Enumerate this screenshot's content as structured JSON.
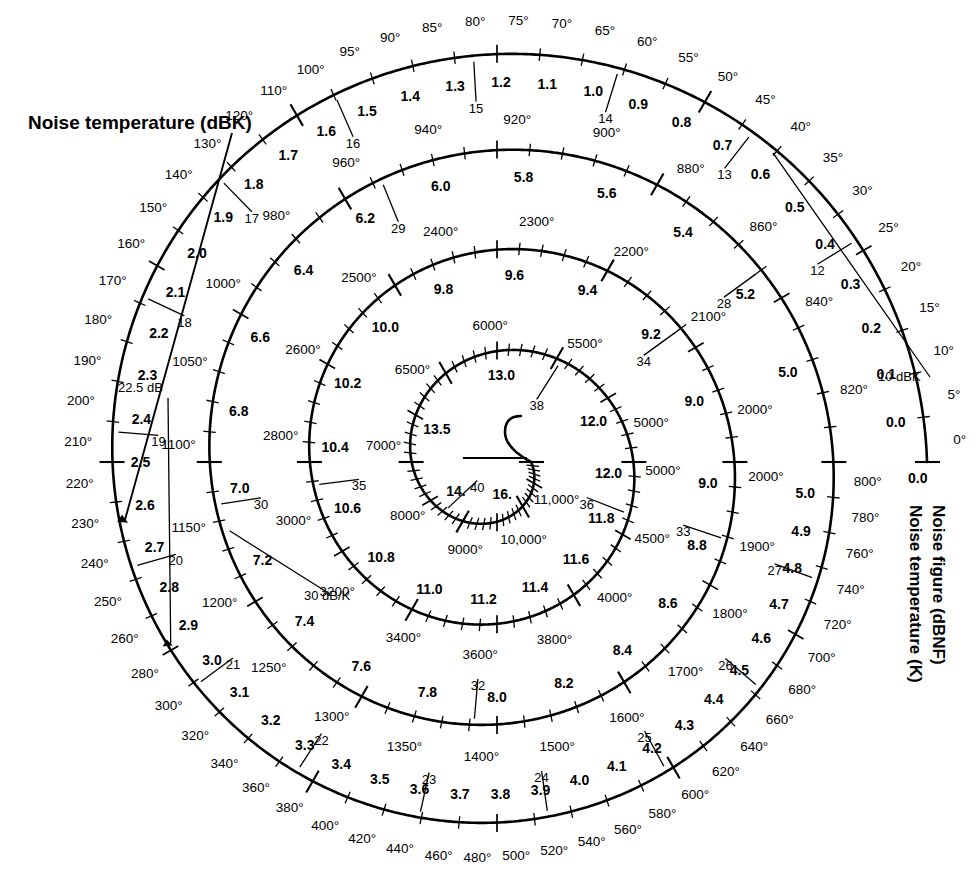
{
  "page": {
    "background": "#ffffff",
    "ink": "#000000"
  },
  "labels": {
    "top_left_title": "Noise temperature (dBK)",
    "right_title_outer": "Noise temperature (K)",
    "right_title_inner": "Noise figure (dBNF)"
  },
  "annotations": [
    {
      "name": "noise-temperature-dbk-callout",
      "text": "Noise temperature (dBK)",
      "points_to": "21",
      "x": 28,
      "y": 130
    },
    {
      "name": "marker-22-5-db",
      "text": "22.5 dB",
      "points_to": "2.0",
      "x": 118,
      "y": 392
    },
    {
      "name": "marker-30-db-per-k",
      "text": "30 dB/K",
      "points_to": "6.5",
      "x": 304,
      "y": 600
    },
    {
      "name": "marker-10-dbk",
      "text": "10 dBK",
      "points_to": "0.25",
      "x": 878,
      "y": 381
    },
    {
      "name": "marker-0-dbk-origin",
      "text": "0.0",
      "points_to": "0",
      "x": 908,
      "y": 483
    }
  ],
  "chart_data": {
    "type": "line",
    "subtype": "archimedean-spiral-nomograph",
    "xlabel": "Noise figure (dBNF)",
    "ylabel": "Noise temperature (K)",
    "grid": false,
    "legend": "none",
    "nf_range_db": [
      0.0,
      16.0
    ],
    "temperature_range_k": [
      0,
      11000
    ],
    "turns": [
      {
        "turn": 1,
        "name": "outer-turn",
        "nf_labels": [
          "0.0",
          "0.1",
          "0.2",
          "0.3",
          "0.4",
          "0.5",
          "0.6",
          "0.7",
          "0.8",
          "0.9",
          "1.0",
          "1.1",
          "1.2",
          "1.3",
          "1.4",
          "1.5",
          "1.6",
          "1.7",
          "1.8",
          "1.9",
          "2.0",
          "2.1",
          "2.2",
          "2.3",
          "2.4",
          "2.5",
          "2.6",
          "2.7",
          "2.8",
          "2.9",
          "3.0",
          "3.1",
          "3.2",
          "3.3",
          "3.4",
          "3.5",
          "3.6",
          "3.7",
          "3.8",
          "3.9",
          "4.0",
          "4.1",
          "4.2",
          "4.3",
          "4.4",
          "4.5",
          "4.6",
          "4.7",
          "4.8",
          "4.9",
          "5.0"
        ],
        "temperature_labels": [
          "0°",
          "5°",
          "10°",
          "15°",
          "20°",
          "25°",
          "30°",
          "35°",
          "40°",
          "45°",
          "50°",
          "55°",
          "60°",
          "65°",
          "70°",
          "75°",
          "80°",
          "85°",
          "90°",
          "95°",
          "100°",
          "110°",
          "120°",
          "130°",
          "140°",
          "150°",
          "160°",
          "170°",
          "180°",
          "190°",
          "200°",
          "210°",
          "220°",
          "230°",
          "240°",
          "250°",
          "260°",
          "280°",
          "300°",
          "320°",
          "340°",
          "360°",
          "380°",
          "400°",
          "420°",
          "440°",
          "460°",
          "480°",
          "500°",
          "520°",
          "540°",
          "560°",
          "580°",
          "600°",
          "620°",
          "640°",
          "660°",
          "680°",
          "700°",
          "720°",
          "740°",
          "760°",
          "780°",
          "800°"
        ],
        "dbk_labels": [
          "12",
          "13",
          "14",
          "15",
          "16",
          "17",
          "18",
          "19",
          "20",
          "21",
          "22",
          "23",
          "24",
          "25",
          "26",
          "27"
        ]
      },
      {
        "turn": 2,
        "name": "second-turn",
        "nf_labels": [
          "5.0",
          "5.2",
          "5.4",
          "5.6",
          "5.8",
          "6.0",
          "6.2",
          "6.4",
          "6.6",
          "6.8",
          "7.0",
          "7.2",
          "7.4",
          "7.6",
          "7.8",
          "8.0",
          "8.2",
          "8.4",
          "8.6",
          "8.8",
          "9.0"
        ],
        "temperature_labels": [
          "820°",
          "840°",
          "860°",
          "880°",
          "900°",
          "920°",
          "940°",
          "960°",
          "980°",
          "1000°",
          "1050°",
          "1100°",
          "1150°",
          "1200°",
          "1250°",
          "1300°",
          "1350°",
          "1400°",
          "1500°",
          "1600°",
          "1700°",
          "1800°",
          "1900°",
          "2000°"
        ],
        "dbk_labels": [
          "28",
          "29",
          "30",
          "32",
          "33"
        ]
      },
      {
        "turn": 3,
        "name": "third-turn",
        "nf_labels": [
          "9.0",
          "9.2",
          "9.4",
          "9.6",
          "9.8",
          "10.0",
          "10.2",
          "10.4",
          "10.6",
          "10.8",
          "11.0",
          "11.2",
          "11.4",
          "11.6",
          "11.8",
          "12.0"
        ],
        "temperature_labels": [
          "2000°",
          "2100°",
          "2200°",
          "2300°",
          "2400°",
          "2500°",
          "2600°",
          "2800°",
          "3000°",
          "3200°",
          "3400°",
          "3600°",
          "3800°",
          "4000°",
          "4500°",
          "5000°"
        ],
        "dbk_labels": [
          "34",
          "35",
          "36"
        ]
      },
      {
        "turn": 4,
        "name": "inner-turn",
        "nf_labels": [
          "12.0",
          "13.0",
          "13.5",
          "14.",
          "16."
        ],
        "temperature_labels": [
          "5000°",
          "5500°",
          "6000°",
          "6500°",
          "7000°",
          "8000°",
          "9000°",
          "10,000°",
          "11,000°"
        ],
        "dbk_labels": [
          "38",
          "40"
        ]
      }
    ],
    "key_pairs": [
      {
        "nf_db": 0.0,
        "temperature_k": 0
      },
      {
        "nf_db": 0.1,
        "temperature_k": 7
      },
      {
        "nf_db": 0.2,
        "temperature_k": 14
      },
      {
        "nf_db": 0.3,
        "temperature_k": 21
      },
      {
        "nf_db": 0.5,
        "temperature_k": 35
      },
      {
        "nf_db": 0.7,
        "temperature_k": 51
      },
      {
        "nf_db": 1.0,
        "temperature_k": 75
      },
      {
        "nf_db": 1.5,
        "temperature_k": 120
      },
      {
        "nf_db": 2.0,
        "temperature_k": 170
      },
      {
        "nf_db": 2.5,
        "temperature_k": 226
      },
      {
        "nf_db": 3.0,
        "temperature_k": 289
      },
      {
        "nf_db": 4.0,
        "temperature_k": 438
      },
      {
        "nf_db": 5.0,
        "temperature_k": 627
      },
      {
        "nf_db": 6.0,
        "temperature_k": 865
      },
      {
        "nf_db": 7.0,
        "temperature_k": 1163
      },
      {
        "nf_db": 8.0,
        "temperature_k": 1540
      },
      {
        "nf_db": 9.0,
        "temperature_k": 2013
      },
      {
        "nf_db": 10.0,
        "temperature_k": 2610
      },
      {
        "nf_db": 11.0,
        "temperature_k": 3360
      },
      {
        "nf_db": 12.0,
        "temperature_k": 4305
      },
      {
        "nf_db": 13.0,
        "temperature_k": 5496
      },
      {
        "nf_db": 14.0,
        "temperature_k": 7000
      },
      {
        "nf_db": 16.0,
        "temperature_k": 11000
      }
    ]
  }
}
